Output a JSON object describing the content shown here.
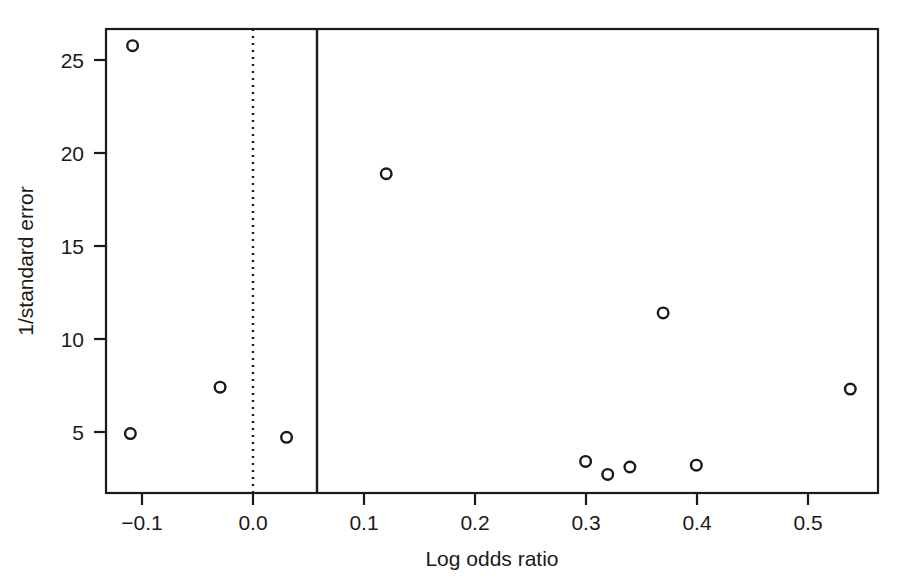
{
  "chart_data": {
    "type": "scatter",
    "title": "",
    "subtitle": "",
    "xlabel": "Log odds ratio",
    "ylabel": "1/standard error",
    "xlim": [
      -0.133,
      0.564
    ],
    "ylim": [
      1.7,
      26.7
    ],
    "xticks": [
      -0.1,
      0.0,
      0.1,
      0.2,
      0.3,
      0.4,
      0.5
    ],
    "xticklabels": [
      "−0.1",
      "0.0",
      "0.1",
      "0.2",
      "0.3",
      "0.4",
      "0.5"
    ],
    "yticks": [
      5,
      10,
      15,
      20,
      25
    ],
    "yticklabels": [
      "5",
      "10",
      "15",
      "20",
      "25"
    ],
    "grid": false,
    "legend": null,
    "marker": "open-circle",
    "marker_color": "#1a1a1a",
    "points": [
      {
        "x": -0.109,
        "y": 25.8
      },
      {
        "x": -0.111,
        "y": 4.9
      },
      {
        "x": -0.03,
        "y": 7.4
      },
      {
        "x": 0.03,
        "y": 4.7
      },
      {
        "x": 0.12,
        "y": 18.9
      },
      {
        "x": 0.37,
        "y": 11.4
      },
      {
        "x": 0.3,
        "y": 3.4
      },
      {
        "x": 0.32,
        "y": 2.7
      },
      {
        "x": 0.34,
        "y": 3.1
      },
      {
        "x": 0.4,
        "y": 3.2
      },
      {
        "x": 0.539,
        "y": 7.3
      }
    ],
    "reference_lines": [
      {
        "name": "null-effect",
        "x": 0.0,
        "style": "dotted"
      },
      {
        "name": "pooled-estimate",
        "x": 0.058,
        "style": "solid"
      }
    ]
  },
  "axes": {
    "x_title": "Log odds ratio",
    "y_title": "1/standard error"
  }
}
